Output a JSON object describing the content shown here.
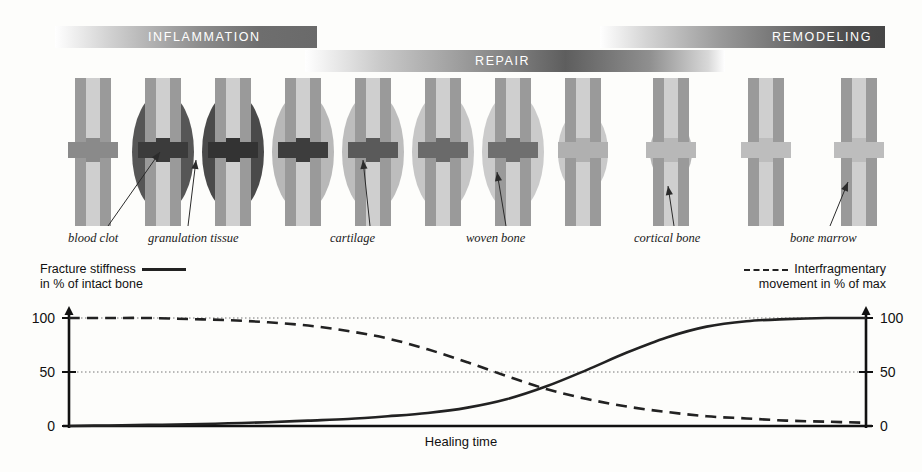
{
  "phases": [
    {
      "id": "inflammation",
      "label": "INFLAMMATION"
    },
    {
      "id": "repair",
      "label": "REPAIR"
    },
    {
      "id": "remodeling",
      "label": "REMODELING"
    }
  ],
  "bones": [
    {
      "index": 1,
      "x": 62,
      "callus": "none",
      "callus_color": "#c4c4c4",
      "gap_color": "#8a8a8a",
      "stage": "fracture-gap"
    },
    {
      "index": 2,
      "x": 132,
      "callus": "large",
      "callus_color": "#565656",
      "gap_color": "#3b3b3b",
      "stage": "hematoma"
    },
    {
      "index": 3,
      "x": 202,
      "callus": "large",
      "callus_color": "#4a4a4a",
      "gap_color": "#333333",
      "stage": "granulation"
    },
    {
      "index": 4,
      "x": 272,
      "callus": "large",
      "callus_color": "#b8b8b8",
      "gap_color": "#3d3d3d",
      "stage": "soft-callus"
    },
    {
      "index": 5,
      "x": 342,
      "callus": "large",
      "callus_color": "#bdbdbd",
      "gap_color": "#5a5a5a",
      "stage": "cartilage"
    },
    {
      "index": 6,
      "x": 412,
      "callus": "large",
      "callus_color": "#c6c6c6",
      "gap_color": "#6a6a6a",
      "stage": "cartilage-late"
    },
    {
      "index": 7,
      "x": 482,
      "callus": "large",
      "callus_color": "#cbcbcb",
      "gap_color": "#6f6f6f",
      "stage": "woven-bone"
    },
    {
      "index": 8,
      "x": 552,
      "callus": "medium",
      "callus_color": "#c9c9c9",
      "gap_color": "#b0b0b0",
      "stage": "hard-callus"
    },
    {
      "index": 9,
      "x": 640,
      "callus": "small",
      "callus_color": "#b5b5b5",
      "gap_color": "#b8b8b8",
      "stage": "remodeling-1"
    },
    {
      "index": 10,
      "x": 735,
      "callus": "tiny",
      "callus_color": "#b0b0b0",
      "gap_color": "#bdbdbd",
      "stage": "remodeling-2"
    },
    {
      "index": 11,
      "x": 828,
      "callus": "none",
      "callus_color": "#b0b0b0",
      "gap_color": "#bdbdbd",
      "stage": "healed"
    }
  ],
  "callouts": [
    {
      "id": "blood-clot",
      "label": "blood clot",
      "x": 68,
      "y": 231,
      "leader_x": 160,
      "leader_top": 152,
      "leader_bottom": 226
    },
    {
      "id": "granulation-tissue",
      "label": "granulation tissue",
      "x": 148,
      "y": 231,
      "leader_x": 196,
      "leader_top": 160,
      "leader_bottom": 226
    },
    {
      "id": "cartilage",
      "label": "cartilage",
      "x": 330,
      "y": 231,
      "leader_x": 363,
      "leader_top": 160,
      "leader_bottom": 226
    },
    {
      "id": "woven-bone",
      "label": "woven bone",
      "x": 466,
      "y": 231,
      "leader_x": 497,
      "leader_top": 172,
      "leader_bottom": 226
    },
    {
      "id": "cortical-bone",
      "label": "cortical bone",
      "x": 634,
      "y": 231,
      "leader_x": 668,
      "leader_top": 186,
      "leader_bottom": 226
    },
    {
      "id": "bone-marrow",
      "label": "bone marrow",
      "x": 790,
      "y": 231,
      "leader_x": 848,
      "leader_top": 182,
      "leader_bottom": 226
    }
  ],
  "chart_data": {
    "type": "line",
    "title": "",
    "xlabel": "Healing time",
    "ylabel": "in % of intact bone",
    "ylabel_right": "movement in % of max",
    "ylim": [
      0,
      100
    ],
    "yticks": [
      0,
      50,
      100
    ],
    "ytick_labels_left": [
      "0",
      "50",
      "100"
    ],
    "ytick_labels_right": [
      "0",
      "50",
      "100"
    ],
    "xlim": [
      0,
      100
    ],
    "grid": true,
    "grid_style": "dotted",
    "legend_position": "top",
    "series": [
      {
        "name": "Fracture stiffness",
        "legend_label_line1": "Fracture stiffness",
        "legend_label_line2": "in % of intact bone",
        "style": "solid",
        "color": "#222222",
        "x": [
          0,
          5,
          10,
          15,
          20,
          25,
          30,
          35,
          40,
          45,
          50,
          55,
          60,
          65,
          70,
          75,
          80,
          85,
          90,
          95,
          100
        ],
        "values": [
          0,
          0.5,
          1,
          1.5,
          2.5,
          3.5,
          5,
          6.5,
          9,
          12,
          17,
          25,
          37,
          52,
          68,
          82,
          92,
          97,
          99,
          100,
          100
        ]
      },
      {
        "name": "Interfragmentary movement",
        "legend_label_line1": "Interfragmentary",
        "legend_label_line2": "movement in % of max",
        "style": "dashed",
        "color": "#222222",
        "x": [
          0,
          5,
          10,
          15,
          20,
          25,
          30,
          35,
          40,
          45,
          50,
          55,
          60,
          65,
          70,
          75,
          80,
          85,
          90,
          95,
          100
        ],
        "values": [
          100,
          100,
          100,
          99,
          98,
          96,
          93,
          88,
          81,
          71,
          59,
          46,
          34,
          25,
          18,
          13,
          9,
          7,
          5,
          4,
          3
        ]
      }
    ]
  }
}
